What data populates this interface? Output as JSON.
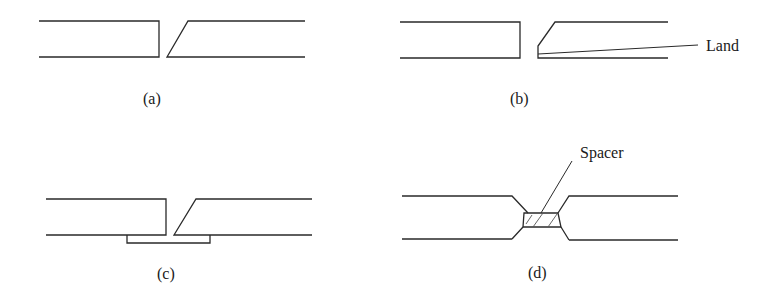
{
  "figure": {
    "panels": [
      {
        "id": "a",
        "caption": "(a)",
        "description": "Single-bevel butt joint, open root"
      },
      {
        "id": "b",
        "caption": "(b)",
        "description": "Single-bevel joint with land",
        "callout": "Land"
      },
      {
        "id": "c",
        "caption": "(c)",
        "description": "Single-bevel joint with backing strip"
      },
      {
        "id": "d",
        "caption": "(d)",
        "description": "Double-bevel joint with spacer",
        "callout": "Spacer"
      }
    ]
  }
}
